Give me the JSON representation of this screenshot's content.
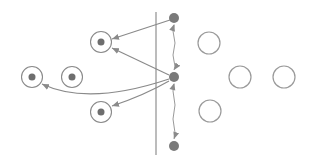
{
  "diagram": {
    "title": "",
    "colors": {
      "stroke": "#8a8a8a",
      "filled_node": "#7a7a7a",
      "inner_dot": "#6e6e6e",
      "empty_ring": "#9a9a9a",
      "arrow": "#8a8a8a",
      "divider": "#8f8f8f"
    },
    "divider": {
      "label": ""
    },
    "filled_nodes": [
      {
        "id": "f-top",
        "label": ""
      },
      {
        "id": "f-mid",
        "label": ""
      },
      {
        "id": "f-bot",
        "label": ""
      }
    ],
    "target_nodes": [
      {
        "id": "t-upper",
        "label": ""
      },
      {
        "id": "t-left-far",
        "label": ""
      },
      {
        "id": "t-left-near",
        "label": ""
      },
      {
        "id": "t-lower",
        "label": ""
      }
    ],
    "empty_nodes": [
      {
        "id": "e-upper",
        "label": ""
      },
      {
        "id": "e-mid-a",
        "label": ""
      },
      {
        "id": "e-mid-b",
        "label": ""
      },
      {
        "id": "e-lower",
        "label": ""
      }
    ],
    "edges": [
      {
        "from": "f-top",
        "to": "t-upper",
        "type": "arrow"
      },
      {
        "from": "f-mid",
        "to": "t-upper",
        "type": "arrow"
      },
      {
        "from": "f-mid",
        "to": "t-left-far",
        "type": "curved-arrow"
      },
      {
        "from": "f-mid",
        "to": "t-lower",
        "type": "arrow"
      },
      {
        "from": "f-top",
        "to": "f-mid",
        "type": "double-arrow-wavy"
      },
      {
        "from": "f-mid",
        "to": "f-bot",
        "type": "double-arrow-wavy"
      }
    ]
  }
}
